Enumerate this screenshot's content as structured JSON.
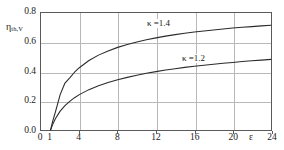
{
  "chart_data": {
    "type": "line",
    "title": "",
    "xlabel": "ε",
    "ylabel": "η",
    "ylabel_sub": "th,V",
    "xlim": [
      0,
      24
    ],
    "ylim": [
      0.0,
      0.8
    ],
    "grid": true,
    "legend": "inline-annotations",
    "x_ticks": [
      {
        "value": 0,
        "label": "0"
      },
      {
        "value": 1,
        "label": "1"
      },
      {
        "value": 4,
        "label": "4"
      },
      {
        "value": 8,
        "label": "8"
      },
      {
        "value": 12,
        "label": "12"
      },
      {
        "value": 16,
        "label": "16"
      },
      {
        "value": 20,
        "label": "20"
      },
      {
        "value": 24,
        "label": "24"
      }
    ],
    "y_ticks": [
      {
        "value": 0.0,
        "label": "0.0"
      },
      {
        "value": 0.2,
        "label": "0.2"
      },
      {
        "value": 0.4,
        "label": "0.4"
      },
      {
        "value": 0.6,
        "label": "0.6"
      },
      {
        "value": 0.8,
        "label": "0.8"
      }
    ],
    "x_gridlines": [
      4,
      8,
      12,
      16,
      20
    ],
    "y_gridlines": [
      0.2,
      0.4,
      0.6
    ],
    "series": [
      {
        "name": "κ=1.4",
        "annotation": "κ =1.4",
        "color": "#2b2b2b",
        "x": [
          1,
          1.2,
          1.5,
          2,
          2.5,
          3,
          3.5,
          4,
          5,
          6,
          7,
          8,
          9,
          10,
          11,
          12,
          13,
          14,
          15,
          16,
          17,
          18,
          19,
          20,
          21,
          22,
          23,
          24
        ],
        "values": [
          0.0,
          0.055,
          0.122,
          0.242,
          0.321,
          0.356,
          0.395,
          0.426,
          0.475,
          0.512,
          0.541,
          0.565,
          0.585,
          0.602,
          0.617,
          0.63,
          0.642,
          0.652,
          0.661,
          0.67,
          0.677,
          0.684,
          0.691,
          0.698,
          0.702,
          0.707,
          0.712,
          0.716
        ]
      },
      {
        "name": "κ=1.2",
        "annotation": "κ =1.2",
        "color": "#2b2b2b",
        "x": [
          1,
          1.2,
          1.5,
          2,
          2.5,
          3,
          3.5,
          4,
          5,
          6,
          7,
          8,
          9,
          10,
          11,
          12,
          13,
          14,
          15,
          16,
          17,
          18,
          19,
          20,
          21,
          22,
          23,
          24
        ],
        "values": [
          0.0,
          0.035,
          0.077,
          0.129,
          0.166,
          0.196,
          0.221,
          0.242,
          0.276,
          0.303,
          0.325,
          0.344,
          0.36,
          0.375,
          0.388,
          0.399,
          0.41,
          0.419,
          0.428,
          0.436,
          0.443,
          0.45,
          0.456,
          0.462,
          0.468,
          0.473,
          0.478,
          0.483
        ]
      }
    ]
  },
  "annotations": {
    "k14_label": "κ =1.4",
    "k12_label": "κ =1.2"
  }
}
